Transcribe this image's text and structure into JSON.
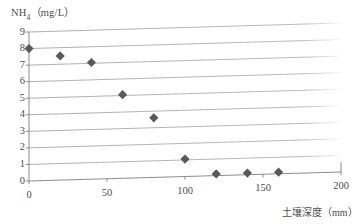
{
  "chart_data": {
    "type": "scatter",
    "title": "",
    "ylabel": "NH₄（mg/L）",
    "ylabel_base": "NH",
    "ylabel_sub": "4",
    "ylabel_unit": "（mg/L）",
    "xlabel": "土壤深度（mm）",
    "xlim": [
      0,
      200
    ],
    "ylim": [
      0,
      9
    ],
    "xticks": [
      0,
      50,
      100,
      150,
      200
    ],
    "yticks": [
      0,
      1,
      2,
      3,
      4,
      5,
      6,
      7,
      8,
      9
    ],
    "xtick_labels": [
      "0",
      "50",
      "100",
      "150",
      "200"
    ],
    "ytick_labels": [
      "0",
      "1",
      "2",
      "3",
      "4",
      "5",
      "6",
      "7",
      "8",
      "9"
    ],
    "grid": true,
    "grid_orientation": "horizontal",
    "legend": false,
    "legend_position": "none",
    "marker": "diamond",
    "marker_color": "#595959",
    "grid_color": "#a6a6a6",
    "axis_color": "#808080",
    "background": "#ffffff",
    "x": [
      0,
      20,
      40,
      60,
      80,
      100,
      120,
      140,
      160
    ],
    "y": [
      8.0,
      7.5,
      7.05,
      5.05,
      3.6,
      1.05,
      0.1,
      0.1,
      0.1
    ],
    "points": [
      {
        "x": 0,
        "y": 8.0
      },
      {
        "x": 20,
        "y": 7.5
      },
      {
        "x": 40,
        "y": 7.05
      },
      {
        "x": 60,
        "y": 5.05
      },
      {
        "x": 80,
        "y": 3.6
      },
      {
        "x": 100,
        "y": 1.05
      },
      {
        "x": 120,
        "y": 0.1
      },
      {
        "x": 140,
        "y": 0.1
      },
      {
        "x": 160,
        "y": 0.1
      }
    ]
  }
}
